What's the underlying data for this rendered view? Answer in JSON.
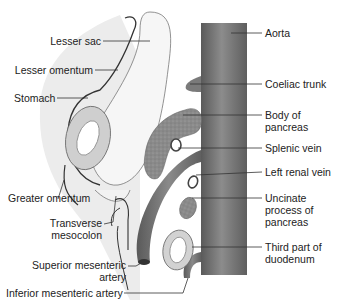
{
  "diagram": {
    "type": "anatomical-sagittal-section",
    "labels_left": {
      "lesser_sac": "Lesser sac",
      "lesser_omentum": "Lesser omentum",
      "stomach": "Stomach",
      "greater_omentum": "Greater omentum",
      "transverse_mesocolon_1": "Transverse",
      "transverse_mesocolon_2": "mesocolon",
      "superior_mesenteric_1": "Superior mesenteric",
      "superior_mesenteric_2": "artery",
      "inferior_mesenteric": "Inferior mesenteric artery"
    },
    "labels_right": {
      "aorta": "Aorta",
      "coeliac_trunk": "Coeliac trunk",
      "body_pancreas_1": "Body of",
      "body_pancreas_2": "pancreas",
      "splenic_vein": "Splenic vein",
      "left_renal_vein": "Left renal vein",
      "uncinate_1": "Uncinate",
      "uncinate_2": "process of",
      "uncinate_3": "pancreas",
      "duodenum_1": "Third part of",
      "duodenum_2": "duodenum"
    },
    "colors": {
      "aorta": "#6f6f6f",
      "pancreas": "#8a8a8a",
      "peritoneum_shade": "#e6e6e6",
      "leader_line": "#333333"
    }
  }
}
